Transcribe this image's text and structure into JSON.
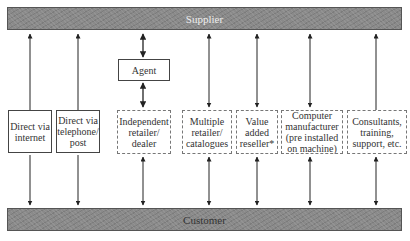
{
  "supplier": {
    "label": "Supplier"
  },
  "customer": {
    "label": "Customer"
  },
  "agent": {
    "label": "Agent"
  },
  "channels": [
    {
      "id": "direct-internet",
      "label": "Direct via internet",
      "style": "solid"
    },
    {
      "id": "direct-telephone",
      "label": "Direct via telephone/ post",
      "style": "solid"
    },
    {
      "id": "independent-retailer",
      "label": "Independent retailer/ dealer",
      "style": "dotted"
    },
    {
      "id": "multiple-retailer",
      "label": "Multiple retailer/ catalogues",
      "style": "dotted"
    },
    {
      "id": "value-added-reseller",
      "label": "Value added reseller*",
      "style": "dotted"
    },
    {
      "id": "computer-manufacturer",
      "label": "Computer manufacturer (pre installed on machine)",
      "style": "dotted"
    },
    {
      "id": "consultants",
      "label": "Consultants, training, support, etc.",
      "style": "dotted"
    }
  ]
}
